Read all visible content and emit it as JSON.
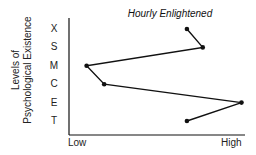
{
  "chart_data": {
    "type": "line",
    "title": "Hourly Enlightened",
    "ylabel": "Levels of Psychological Existence",
    "ylabel_lines": [
      "Levels of",
      "Psychological Existence"
    ],
    "xlabel": "",
    "x_tick_labels": [
      "Low",
      "High"
    ],
    "categories": [
      "X",
      "S",
      "M",
      "C",
      "E",
      "T"
    ],
    "series": [
      {
        "name": "Hourly Enlightened",
        "values": [
          0.67,
          0.76,
          0.1,
          0.2,
          0.98,
          0.67
        ]
      }
    ],
    "xlim": [
      0,
      1
    ],
    "grid": false,
    "legend": "none",
    "orientation": "horizontal-value, vertical-category"
  },
  "colors": {
    "line": "#111111",
    "axis": "#111111",
    "text": "#222222"
  }
}
